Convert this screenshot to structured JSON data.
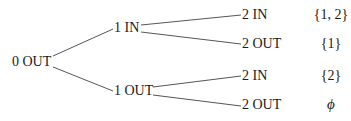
{
  "tree": {
    "root": {
      "label": "0 OUT"
    },
    "level1": [
      {
        "label": "1 IN"
      },
      {
        "label": "1 OUT"
      }
    ],
    "level2": [
      {
        "label": "2 IN",
        "set": "{1, 2}"
      },
      {
        "label": "2 OUT",
        "set": "{1}"
      },
      {
        "label": "2 IN",
        "set": "{2}"
      },
      {
        "label": "2 OUT",
        "set": "ϕ"
      }
    ]
  },
  "colors": {
    "line": "#555555",
    "text": "#1a1a1a"
  }
}
